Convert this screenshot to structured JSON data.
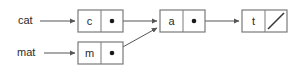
{
  "diagram": {
    "background_color": "#ffffff",
    "stroke_color": "#7a7a7a",
    "arrow_color": "#555555",
    "text_color": "#2b2b2b",
    "labels": [
      {
        "name": "cat-variable-label",
        "text": "cat",
        "x": 18,
        "y": 17
      },
      {
        "name": "mat-variable-label",
        "text": "mat",
        "x": 17,
        "y": 49
      }
    ],
    "nodes": [
      {
        "id": "node-c",
        "value": "c",
        "pointer": "dot",
        "x": 78,
        "y": 10,
        "width": 45,
        "height": 22,
        "split": 23
      },
      {
        "id": "node-a",
        "value": "a",
        "pointer": "dot",
        "x": 160,
        "y": 10,
        "width": 45,
        "height": 22,
        "split": 23
      },
      {
        "id": "node-t",
        "value": "t",
        "pointer": "null-slash",
        "x": 242,
        "y": 10,
        "width": 45,
        "height": 22,
        "split": 23
      },
      {
        "id": "node-m",
        "value": "m",
        "pointer": "dot",
        "x": 78,
        "y": 42,
        "width": 45,
        "height": 22,
        "split": 23
      }
    ],
    "edges": [
      {
        "name": "edge-cat-to-c",
        "from": "cat-variable-label",
        "to": "node-c",
        "kind": "straight",
        "x1": 40,
        "y1": 21,
        "x2": 76,
        "y2": 21
      },
      {
        "name": "edge-c-to-a",
        "from": "node-c",
        "to": "node-a",
        "kind": "straight",
        "x1": 113,
        "y1": 21,
        "x2": 158,
        "y2": 21
      },
      {
        "name": "edge-a-to-t",
        "from": "node-a",
        "to": "node-t",
        "kind": "straight",
        "x1": 195,
        "y1": 21,
        "x2": 240,
        "y2": 21
      },
      {
        "name": "edge-mat-to-m",
        "from": "mat-variable-label",
        "to": "node-m",
        "kind": "straight",
        "x1": 43,
        "y1": 53,
        "x2": 76,
        "y2": 53
      },
      {
        "name": "edge-m-to-a",
        "from": "node-m",
        "to": "node-a",
        "kind": "diagonal",
        "x1": 113,
        "y1": 53,
        "x2": 158,
        "y2": 27
      }
    ]
  }
}
